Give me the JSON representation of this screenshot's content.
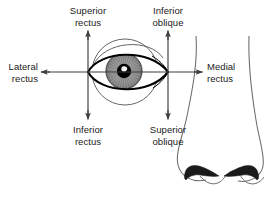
{
  "diagram": {
    "background_color": "#ffffff",
    "line_color": "#3c3c3c",
    "ink_color": "#1a1a1a",
    "iris_color": "#9a9a9a",
    "pupil_color": "#000000"
  },
  "labels": {
    "superior_rectus": "Superior\nrectus",
    "inferior_oblique": "Inferior\noblique",
    "lateral_rectus": "Lateral\nrectus",
    "medial_rectus": "Medial\nrectus",
    "inferior_rectus": "Inferior\nrectus",
    "superior_oblique": "Superior\noblique"
  },
  "arrows": [
    {
      "name": "superior-rectus-arrow",
      "direction": "up",
      "from": [
        88,
        120
      ],
      "to": [
        88,
        29
      ]
    },
    {
      "name": "inferior-oblique-arrow",
      "direction": "up",
      "from": [
        168,
        120
      ],
      "to": [
        168,
        29
      ]
    },
    {
      "name": "lateral-rectus-arrow",
      "direction": "left",
      "from": [
        168,
        72
      ],
      "to": [
        40,
        72
      ]
    },
    {
      "name": "medial-rectus-arrow",
      "direction": "right",
      "from": [
        88,
        72
      ],
      "to": [
        203,
        72
      ]
    },
    {
      "name": "inferior-rectus-arrow",
      "direction": "down",
      "from": [
        88,
        29
      ],
      "to": [
        88,
        120
      ]
    },
    {
      "name": "superior-oblique-arrow",
      "direction": "down",
      "from": [
        168,
        29
      ],
      "to": [
        168,
        120
      ]
    }
  ],
  "anatomy": {
    "eyeball_outline": "thin circle centered at (125,72) radius 33",
    "eyelid_opening": "almond shape from left canthus (88,72) to right canthus (168,72)",
    "iris": "gray disc centered at (124,71) radius 18 with radial striations",
    "pupil": "black disc centered at (124,71) radius 7 with white highlight",
    "nose": "profile of nose at right with two dark nostrils and tip curve"
  }
}
